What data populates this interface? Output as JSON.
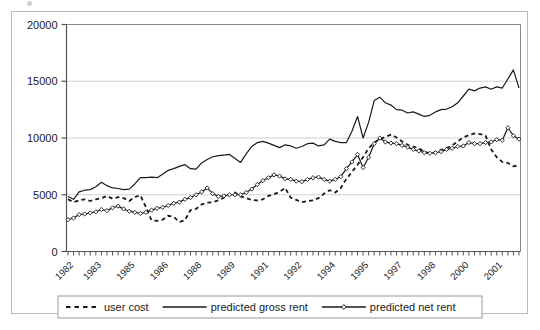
{
  "chart_data": {
    "type": "line",
    "title": "",
    "xlabel": "",
    "ylabel": "",
    "ylim": [
      0,
      20000
    ],
    "ytick_labels": [
      "0",
      "5000",
      "10000",
      "15000",
      "20000"
    ],
    "ytick_values": [
      0,
      5000,
      10000,
      15000,
      20000
    ],
    "grid": true,
    "legend_position": "bottom",
    "x_axis_note": "quarterly observations, 1982Q1 through 2002Q2",
    "xtick_labels": [
      "1982",
      "1983",
      "1985",
      "1986",
      "1988",
      "1989",
      "1991",
      "1992",
      "1994",
      "1995",
      "1997",
      "1998",
      "2000",
      "2001"
    ],
    "xtick_label_indices": [
      0,
      5,
      11,
      17,
      23,
      29,
      35,
      41,
      47,
      53,
      59,
      65,
      71,
      77
    ],
    "x": [
      "1982Q1",
      "1982Q2",
      "1982Q3",
      "1982Q4",
      "1983Q1",
      "1983Q2",
      "1983Q3",
      "1983Q4",
      "1984Q1",
      "1984Q2",
      "1984Q3",
      "1984Q4",
      "1985Q1",
      "1985Q2",
      "1985Q3",
      "1985Q4",
      "1986Q1",
      "1986Q2",
      "1986Q3",
      "1986Q4",
      "1987Q1",
      "1987Q2",
      "1987Q3",
      "1987Q4",
      "1988Q1",
      "1988Q2",
      "1988Q3",
      "1988Q4",
      "1989Q1",
      "1989Q2",
      "1989Q3",
      "1989Q4",
      "1990Q1",
      "1990Q2",
      "1990Q3",
      "1990Q4",
      "1991Q1",
      "1991Q2",
      "1991Q3",
      "1991Q4",
      "1992Q1",
      "1992Q2",
      "1992Q3",
      "1992Q4",
      "1993Q1",
      "1993Q2",
      "1993Q3",
      "1993Q4",
      "1994Q1",
      "1994Q2",
      "1994Q3",
      "1994Q4",
      "1995Q1",
      "1995Q2",
      "1995Q3",
      "1995Q4",
      "1996Q1",
      "1996Q2",
      "1996Q3",
      "1996Q4",
      "1997Q1",
      "1997Q2",
      "1997Q3",
      "1997Q4",
      "1998Q1",
      "1998Q2",
      "1998Q3",
      "1998Q4",
      "1999Q1",
      "1999Q2",
      "1999Q3",
      "1999Q4",
      "2000Q1",
      "2000Q2",
      "2000Q3",
      "2000Q4",
      "2001Q1",
      "2001Q2",
      "2001Q3",
      "2001Q4",
      "2002Q1",
      "2002Q2"
    ],
    "series": [
      {
        "name": "user cost",
        "style": "dashed",
        "marker": "none",
        "color": "#1a1a1a",
        "values": [
          4600,
          4350,
          4500,
          4600,
          4450,
          4600,
          4700,
          4900,
          4650,
          4800,
          4700,
          4450,
          4800,
          4950,
          3900,
          2750,
          2700,
          2800,
          3150,
          3050,
          2600,
          2750,
          3650,
          3750,
          4150,
          4300,
          4350,
          4500,
          4750,
          5000,
          5200,
          4850,
          4700,
          4550,
          4500,
          4600,
          4900,
          5050,
          5250,
          5600,
          4750,
          4550,
          4350,
          4450,
          4500,
          4700,
          5100,
          5400,
          5200,
          5600,
          6400,
          7000,
          7650,
          8300,
          9100,
          9600,
          9900,
          10100,
          10300,
          10050,
          9700,
          9400,
          9250,
          9100,
          8800,
          8650,
          8750,
          8950,
          9100,
          9350,
          9700,
          10050,
          10250,
          10400,
          10350,
          10200,
          9000,
          8300,
          7900,
          7800,
          7500,
          7600
        ]
      },
      {
        "name": "predicted gross rent",
        "style": "solid",
        "marker": "none",
        "color": "#1a1a1a",
        "values": [
          4850,
          4600,
          5250,
          5400,
          5450,
          5700,
          6100,
          5800,
          5600,
          5550,
          5450,
          5500,
          5950,
          6500,
          6500,
          6550,
          6500,
          6800,
          7150,
          7300,
          7500,
          7650,
          7300,
          7250,
          7800,
          8100,
          8350,
          8450,
          8500,
          8550,
          8200,
          7850,
          8600,
          9250,
          9600,
          9700,
          9550,
          9350,
          9150,
          9400,
          9300,
          9100,
          9250,
          9500,
          9550,
          9300,
          9400,
          9900,
          9700,
          9600,
          9600,
          10600,
          11900,
          10000,
          11400,
          13300,
          13600,
          13100,
          12900,
          12500,
          12450,
          12200,
          12300,
          12100,
          11900,
          12000,
          12300,
          12500,
          12550,
          12750,
          13100,
          13700,
          14300,
          14150,
          14400,
          14500,
          14300,
          14500,
          14400,
          15200,
          16000,
          14400
        ]
      },
      {
        "name": "predicted net rent",
        "style": "solid",
        "marker": "diamond",
        "color": "#1a1a1a",
        "values": [
          2800,
          2950,
          3250,
          3300,
          3400,
          3500,
          3700,
          3600,
          3850,
          4000,
          3750,
          3550,
          3450,
          3350,
          3450,
          3650,
          3800,
          3900,
          4050,
          4250,
          4350,
          4600,
          4750,
          5000,
          5250,
          5600,
          5100,
          4850,
          4900,
          5000,
          5000,
          5000,
          5200,
          5500,
          5900,
          6250,
          6500,
          6750,
          6650,
          6400,
          6350,
          6200,
          6150,
          6350,
          6500,
          6550,
          6350,
          6200,
          6350,
          6600,
          7300,
          7900,
          8550,
          7400,
          8300,
          9500,
          10000,
          9650,
          9550,
          9500,
          9350,
          9200,
          9000,
          8850,
          8700,
          8650,
          8700,
          8800,
          9000,
          9100,
          9250,
          9300,
          9600,
          9500,
          9500,
          9600,
          9650,
          9850,
          9800,
          10900,
          10200,
          9900
        ]
      }
    ]
  },
  "legend": {
    "items": [
      {
        "label": "user cost",
        "style": "dashed"
      },
      {
        "label": "predicted gross rent",
        "style": "solid"
      },
      {
        "label": "predicted net rent",
        "style": "solid-diamond"
      }
    ]
  }
}
